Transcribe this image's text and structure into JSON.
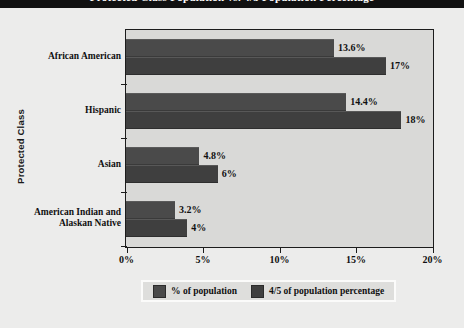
{
  "title_bar": {
    "text": "Protected Class Population vs. 4/5 Population Percentage"
  },
  "chart_data": {
    "type": "bar",
    "orientation": "horizontal",
    "title": "Protected Class Population vs. 4/5 Population Percentage",
    "xlabel": "",
    "ylabel": "Protected Class",
    "xlim": [
      0,
      20
    ],
    "xticks": [
      0,
      5,
      10,
      15,
      20
    ],
    "xtick_labels": [
      "0%",
      "5%",
      "10%",
      "15%",
      "20%"
    ],
    "grid": false,
    "legend_position": "bottom",
    "categories": [
      "African American",
      "Hispanic",
      "Asian",
      "American Indian and\nAlaskan Native"
    ],
    "series": [
      {
        "name": "% of population",
        "color": "#4a4a4a",
        "values": [
          13.6,
          14.4,
          4.8,
          3.2
        ],
        "labels": [
          "13.6%",
          "14.4%",
          "4.8%",
          "3.2%"
        ]
      },
      {
        "name": "4/5 of population percentage",
        "color": "#3f3f3f",
        "values": [
          17,
          18,
          6,
          4
        ],
        "labels": [
          "17%",
          "18%",
          "6%",
          "4%"
        ]
      }
    ]
  },
  "axes": {
    "y_axis_title": "Protected Class"
  },
  "legend": {
    "entries": [
      {
        "label": "% of population"
      },
      {
        "label": "4/5 of population percentage"
      }
    ]
  },
  "colors": {
    "page_background": "#ececeb",
    "plot_background": "#d9d9d7",
    "axis": "#1c1c1c",
    "series0": "#4a4a4a",
    "series1": "#3f3f3f",
    "title_bar": "#111111"
  }
}
